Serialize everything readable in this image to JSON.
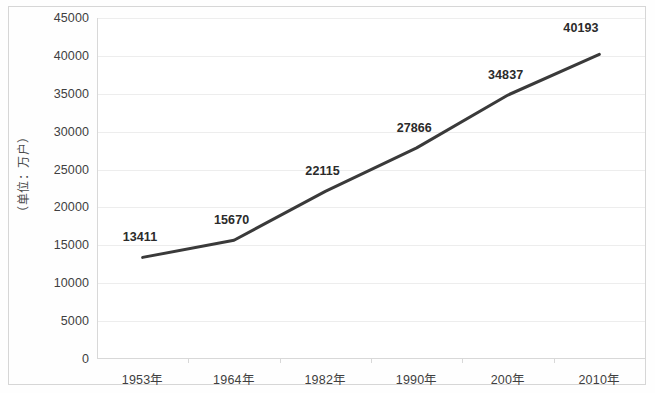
{
  "chart_data": {
    "type": "line",
    "title": "",
    "subtitle": "",
    "xlabel": "",
    "ylabel": "（单位：万户）",
    "categories": [
      "1953年",
      "1964年",
      "1982年",
      "1990年",
      "200年",
      "2010年"
    ],
    "values": [
      13411,
      15670,
      22115,
      27866,
      34837,
      40193
    ],
    "data_labels": [
      "13411",
      "15670",
      "22115",
      "27866",
      "34837",
      "40193"
    ],
    "series": [
      {
        "name": "户数",
        "values": [
          13411,
          15670,
          22115,
          27866,
          34837,
          40193
        ],
        "color": "#3a3a3a"
      }
    ],
    "ylim": [
      0,
      45000
    ],
    "ytick_step": 5000,
    "ytick_labels": [
      "0",
      "5000",
      "10000",
      "15000",
      "20000",
      "25000",
      "30000",
      "35000",
      "40000",
      "45000"
    ],
    "ytick_values": [
      0,
      5000,
      10000,
      15000,
      20000,
      25000,
      30000,
      35000,
      40000,
      45000
    ],
    "grid": true,
    "grid_axis": "y",
    "legend": false,
    "legend_position": "none",
    "markers": false,
    "line_width": 3,
    "colors": {
      "line": "#3a3a3a",
      "grid": "#ededed",
      "axis": "#d8d8d8",
      "frame": "#d6d6d6",
      "text": "#3f3f3f",
      "label_text": "#2b2b2b",
      "background": "#ffffff"
    }
  }
}
